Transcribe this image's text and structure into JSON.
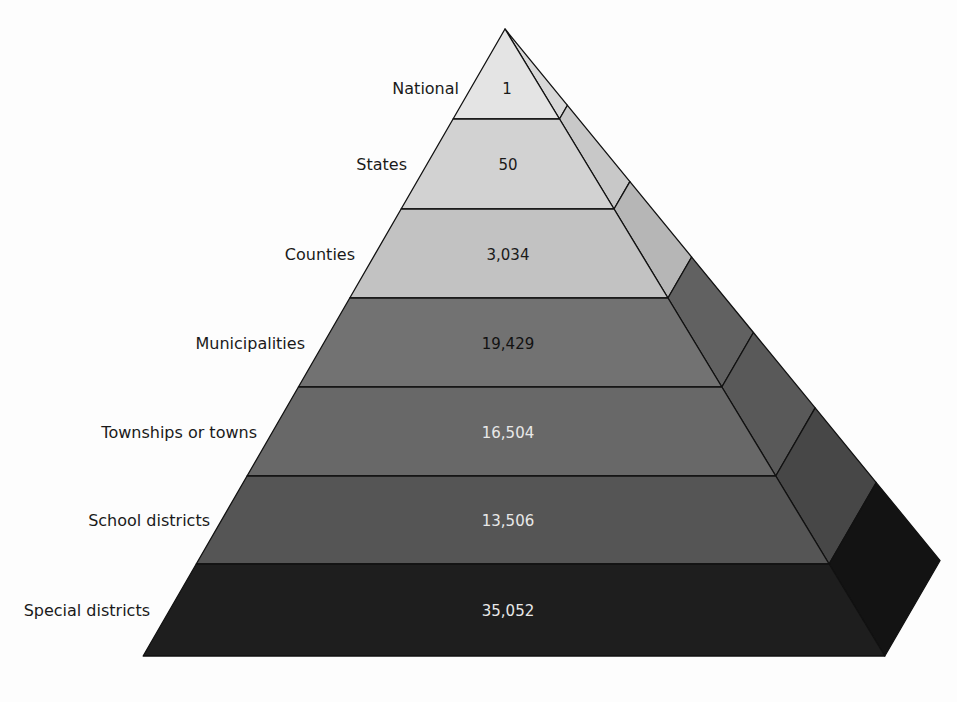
{
  "chart_data": {
    "type": "pyramid",
    "title": "",
    "levels": [
      {
        "name": "National",
        "value": 1,
        "display": "1"
      },
      {
        "name": "States",
        "value": 50,
        "display": "50"
      },
      {
        "name": "Counties",
        "value": 3034,
        "display": "3,034"
      },
      {
        "name": "Municipalities",
        "value": 19429,
        "display": "19,429"
      },
      {
        "name": "Townships or towns",
        "value": 16504,
        "display": "16,504"
      },
      {
        "name": "School districts",
        "value": 13506,
        "display": "13,506"
      },
      {
        "name": "Special districts",
        "value": 35052,
        "display": "35,052"
      }
    ]
  },
  "pyramid": {
    "levels": [
      {
        "label": "National",
        "value": "1",
        "front_color": "#e4e4e4",
        "side_color": "#d8d8d8",
        "text_color": "#1a1a1a"
      },
      {
        "label": "States",
        "value": "50",
        "front_color": "#d2d2d2",
        "side_color": "#c8c8c8",
        "text_color": "#1a1a1a"
      },
      {
        "label": "Counties",
        "value": "3,034",
        "front_color": "#c2c2c2",
        "side_color": "#b6b6b6",
        "text_color": "#1a1a1a"
      },
      {
        "label": "Municipalities",
        "value": "19,429",
        "front_color": "#727272",
        "side_color": "#616161",
        "text_color": "#111111"
      },
      {
        "label": "Townships or towns",
        "value": "16,504",
        "front_color": "#686868",
        "side_color": "#595959",
        "text_color": "#e8e8e8"
      },
      {
        "label": "School districts",
        "value": "13,506",
        "front_color": "#555555",
        "side_color": "#474747",
        "text_color": "#e8e8e8"
      },
      {
        "label": "Special districts",
        "value": "35,052",
        "front_color": "#1e1e1e",
        "side_color": "#131313",
        "text_color": "#e8e8e8"
      }
    ]
  }
}
